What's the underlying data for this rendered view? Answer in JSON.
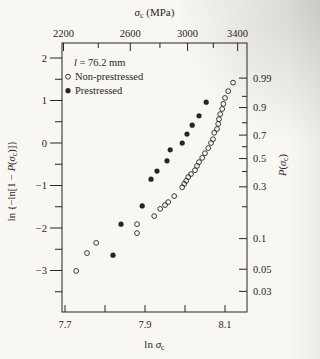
{
  "colors": {
    "paper": "#f9f7f2",
    "ink": "#262626"
  },
  "chart_data": {
    "type": "scatter",
    "title": "",
    "top_axis": {
      "label": "σc (MPa)",
      "label_parts": [
        {
          "t": "σ",
          "i": true
        },
        {
          "t": "c",
          "sub": true
        },
        {
          "t": " (MPa)"
        }
      ],
      "major_ticks": [
        2200,
        2600,
        3000,
        3400
      ],
      "minor_ticks": [
        2400,
        2800,
        3200
      ],
      "scale": "ln-linked-to-bottom-axis"
    },
    "bottom_axis": {
      "label": "ln σc",
      "label_parts": [
        {
          "t": "ln "
        },
        {
          "t": "σ",
          "i": true
        },
        {
          "t": "c",
          "sub": true
        }
      ],
      "labeled_ticks": [
        7.7,
        7.9,
        8.1
      ],
      "unlabeled_ticks": [
        7.8,
        8.0
      ],
      "range": [
        7.69,
        8.16
      ]
    },
    "left_axis": {
      "label": "ln {−ln[1 − P(σc)]}",
      "label_parts": [
        {
          "t": "ln {−ln[1 − "
        },
        {
          "t": "P",
          "i": true
        },
        {
          "t": "("
        },
        {
          "t": "σ",
          "i": true
        },
        {
          "t": "c",
          "sub": true
        },
        {
          "t": ")]}"
        }
      ],
      "major_ticks": [
        2,
        1,
        0,
        -1,
        -2,
        -3
      ],
      "minor_ticks": [
        1.5,
        0.5,
        -0.5,
        -1.5,
        -2.5,
        -3.5
      ],
      "range": [
        -3.97,
        2.35
      ]
    },
    "right_axis": {
      "label": "P(σc)",
      "label_parts": [
        {
          "t": "P",
          "i": true
        },
        {
          "t": "("
        },
        {
          "t": "σ",
          "i": true
        },
        {
          "t": "c",
          "sub": true
        },
        {
          "t": ")"
        }
      ],
      "labeled_ticks": [
        0.99,
        0.9,
        0.7,
        0.5,
        0.3,
        0.1,
        0.05,
        0.03
      ],
      "minor_ticks": [
        0.95,
        0.8,
        0.6,
        0.4,
        0.2
      ],
      "scale": "weibull-probability"
    },
    "legend": {
      "note": "l = 76.2 mm",
      "note_parts": [
        {
          "t": "l",
          "i": true
        },
        {
          "t": " = 76.2 mm"
        }
      ],
      "entries": [
        {
          "marker": "open-circle",
          "label": "Non-prestressed"
        },
        {
          "marker": "filled-circle",
          "label": "Prestressed"
        }
      ]
    },
    "series": [
      {
        "name": "Non-prestressed",
        "marker": "open-circle",
        "x_variable": "ln σc",
        "y_variable": "ln{−ln[1 − P(σc)]}",
        "points": [
          [
            8.12,
            1.42
          ],
          [
            8.108,
            1.22
          ],
          [
            8.1,
            1.06
          ],
          [
            8.096,
            0.92
          ],
          [
            8.093,
            0.8
          ],
          [
            8.088,
            0.68
          ],
          [
            8.085,
            0.56
          ],
          [
            8.083,
            0.45
          ],
          [
            8.08,
            0.33
          ],
          [
            8.073,
            0.24
          ],
          [
            8.07,
            0.09
          ],
          [
            8.065,
            0.0
          ],
          [
            8.058,
            -0.12
          ],
          [
            8.05,
            -0.24
          ],
          [
            8.043,
            -0.35
          ],
          [
            8.035,
            -0.45
          ],
          [
            8.03,
            -0.54
          ],
          [
            8.025,
            -0.64
          ],
          [
            8.015,
            -0.73
          ],
          [
            8.008,
            -0.8
          ],
          [
            8.003,
            -0.89
          ],
          [
            7.998,
            -0.96
          ],
          [
            7.993,
            -1.04
          ],
          [
            7.973,
            -1.25
          ],
          [
            7.958,
            -1.39
          ],
          [
            7.95,
            -1.46
          ],
          [
            7.938,
            -1.55
          ],
          [
            7.923,
            -1.72
          ],
          [
            7.88,
            -1.91
          ],
          [
            7.88,
            -2.12
          ],
          [
            7.778,
            -2.35
          ],
          [
            7.755,
            -2.59
          ],
          [
            7.728,
            -3.01
          ]
        ]
      },
      {
        "name": "Prestressed",
        "marker": "filled-circle",
        "x_variable": "ln σc",
        "y_variable": "ln{−ln[1 − P(σc)]}",
        "points": [
          [
            8.053,
            0.96
          ],
          [
            8.035,
            0.64
          ],
          [
            8.018,
            0.42
          ],
          [
            8.005,
            0.21
          ],
          [
            7.993,
            0.0
          ],
          [
            7.963,
            -0.16
          ],
          [
            7.955,
            -0.42
          ],
          [
            7.93,
            -0.66
          ],
          [
            7.915,
            -0.85
          ],
          [
            7.893,
            -1.48
          ],
          [
            7.84,
            -1.91
          ],
          [
            7.82,
            -2.64
          ]
        ]
      }
    ]
  }
}
